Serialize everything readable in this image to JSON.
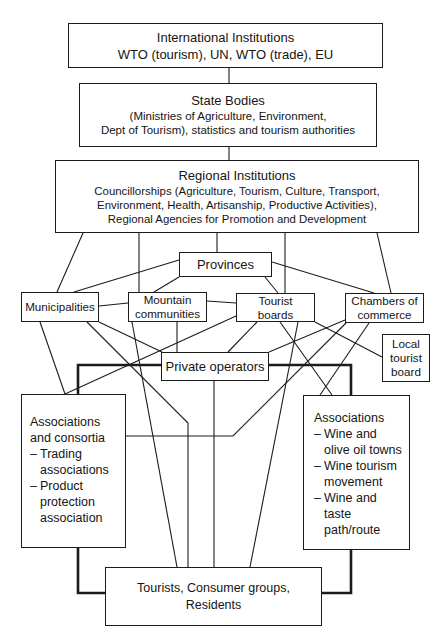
{
  "diagram": {
    "international": {
      "title": "International Institutions",
      "lines": [
        "WTO (tourism), UN, WTO (trade), EU"
      ]
    },
    "state": {
      "title": "State Bodies",
      "lines": [
        "(Ministries of Agriculture, Environment,",
        "Dept of Tourism), statistics and tourism authorities"
      ]
    },
    "regional": {
      "title": "Regional Institutions",
      "lines": [
        "Councillorships (Agriculture, Tourism, Culture, Transport,",
        "Environment, Health, Artisanship, Productive Activities),",
        "Regional Agencies for Promotion and Development"
      ]
    },
    "provinces": {
      "label": "Provinces"
    },
    "municipalities": {
      "label": "Municipalities"
    },
    "mountain_communities": {
      "lines": [
        "Mountain",
        "communities"
      ]
    },
    "tourist_boards": {
      "lines": [
        "Tourist",
        "boards"
      ]
    },
    "chambers_of_commerce": {
      "lines": [
        "Chambers of",
        "commerce"
      ]
    },
    "local_tourist_board": {
      "lines": [
        "Local",
        "tourist",
        "board"
      ]
    },
    "private_operators": {
      "label": "Private operators"
    },
    "associations_consortia": {
      "heading": [
        "Associations",
        "and consortia"
      ],
      "bullet": "–",
      "items": [
        [
          "Trading",
          "associations"
        ],
        [
          "Product",
          "protection",
          "association"
        ]
      ]
    },
    "associations": {
      "heading": [
        "Associations"
      ],
      "bullet": "–",
      "items": [
        [
          "Wine and",
          "olive oil towns"
        ],
        [
          "Wine tourism",
          "movement"
        ],
        [
          "Wine and",
          "taste",
          "path/route"
        ]
      ]
    },
    "tourists": {
      "lines": [
        "Tourists, Consumer groups,",
        "Residents"
      ]
    }
  },
  "edges": [
    {
      "from": "International Institutions",
      "to": "State Bodies",
      "style": "thin"
    },
    {
      "from": "State Bodies",
      "to": "Regional Institutions",
      "style": "thin"
    },
    {
      "from": "Regional Institutions",
      "to": "Municipalities",
      "style": "thin"
    },
    {
      "from": "Regional Institutions",
      "to": "Mountain communities",
      "style": "thin"
    },
    {
      "from": "Regional Institutions",
      "to": "Provinces",
      "style": "thin"
    },
    {
      "from": "Regional Institutions",
      "to": "Tourist boards",
      "style": "thin"
    },
    {
      "from": "Regional Institutions",
      "to": "Chambers of commerce",
      "style": "thin"
    },
    {
      "from": "Provinces",
      "to": "Municipalities",
      "style": "thin"
    },
    {
      "from": "Provinces",
      "to": "Mountain communities",
      "style": "thin"
    },
    {
      "from": "Provinces",
      "to": "Tourist boards",
      "style": "thin"
    },
    {
      "from": "Provinces",
      "to": "Chambers of commerce",
      "style": "thin"
    },
    {
      "from": "Municipalities",
      "to": "Mountain communities",
      "style": "thin"
    },
    {
      "from": "Mountain communities",
      "to": "Tourist boards",
      "style": "thin"
    },
    {
      "from": "Municipalities",
      "to": "Associations and consortia",
      "style": "thin"
    },
    {
      "from": "Municipalities",
      "to": "Tourists, Consumer groups, Residents",
      "style": "thin"
    },
    {
      "from": "Municipalities",
      "to": "Private operators",
      "style": "thin"
    },
    {
      "from": "Mountain communities",
      "to": "Tourists, Consumer groups, Residents",
      "style": "thin"
    },
    {
      "from": "Mountain communities",
      "to": "Private operators",
      "style": "thin"
    },
    {
      "from": "Tourist boards",
      "to": "Associations and consortia",
      "style": "thin"
    },
    {
      "from": "Tourist boards",
      "to": "Private operators",
      "style": "thin"
    },
    {
      "from": "Tourist boards",
      "to": "Associations",
      "style": "thin"
    },
    {
      "from": "Tourist boards",
      "to": "Tourists, Consumer groups, Residents",
      "style": "thin"
    },
    {
      "from": "Tourist boards",
      "to": "Local tourist board",
      "style": "thin"
    },
    {
      "from": "Chambers of commerce",
      "to": "Private operators",
      "style": "thin"
    },
    {
      "from": "Chambers of commerce",
      "to": "Associations and consortia",
      "style": "thin"
    },
    {
      "from": "Chambers of commerce",
      "to": "Associations",
      "style": "thin"
    },
    {
      "from": "Private operators",
      "to": "Tourists, Consumer groups, Residents",
      "style": "thin"
    },
    {
      "from": "Associations and consortia",
      "to": "Private operators",
      "style": "thick"
    },
    {
      "from": "Private operators",
      "to": "Associations",
      "style": "thick"
    },
    {
      "from": "Associations and consortia",
      "to": "Tourists, Consumer groups, Residents",
      "style": "thick"
    },
    {
      "from": "Tourists, Consumer groups, Residents",
      "to": "Associations",
      "style": "thick"
    }
  ]
}
